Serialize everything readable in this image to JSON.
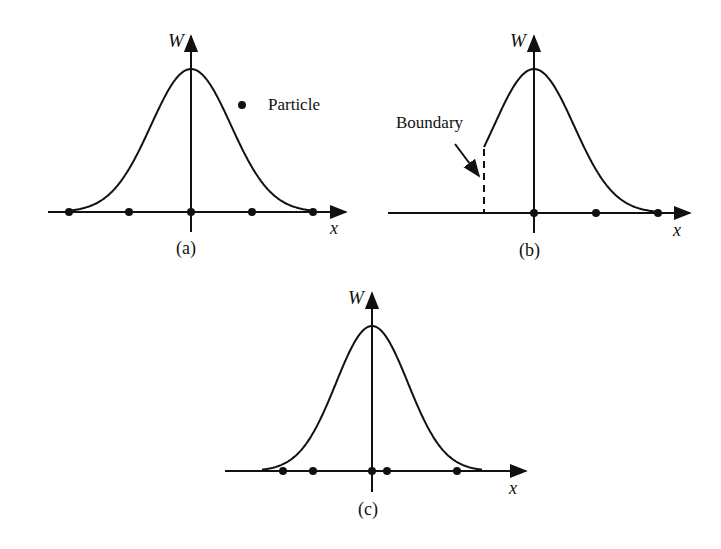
{
  "figure": {
    "ink_color": "#111111",
    "background": "#ffffff",
    "legend": {
      "marker": "filled-dot",
      "label": "Particle"
    },
    "panels": [
      {
        "id": "a",
        "caption": "(a)",
        "y_axis_label": "W",
        "x_axis_label": "x",
        "curve": "gaussian",
        "particles_relative_to_center_px": [
          -122,
          -62,
          0,
          61,
          122
        ]
      },
      {
        "id": "b",
        "caption": "(b)",
        "y_axis_label": "W",
        "x_axis_label": "x",
        "curve": "gaussian truncated at boundary (left side)",
        "annotation": "Boundary",
        "particles_relative_to_center_px": [
          0,
          62,
          124
        ]
      },
      {
        "id": "c",
        "caption": "(c)",
        "y_axis_label": "W",
        "x_axis_label": "x",
        "curve": "gaussian",
        "particles_relative_to_center_px": [
          -89,
          -59,
          0,
          15,
          85
        ]
      }
    ]
  }
}
